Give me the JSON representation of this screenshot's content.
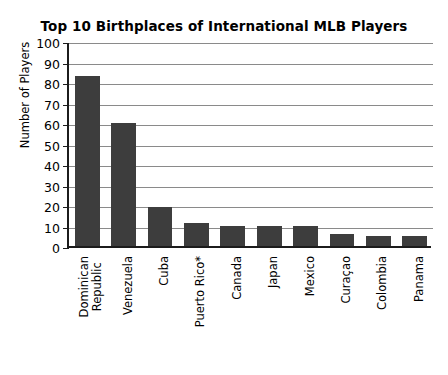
{
  "chart_data": {
    "type": "bar",
    "title": "Top 10 Birthplaces of International MLB Players",
    "xlabel": "",
    "ylabel": "Number of Players",
    "ylim": [
      0,
      100
    ],
    "ytick_step": 10,
    "ytick_labels": [
      "100",
      "90",
      "80",
      "70",
      "60",
      "50",
      "40",
      "30",
      "20",
      "10",
      "0"
    ],
    "ytick_values": [
      100,
      90,
      80,
      70,
      60,
      50,
      40,
      30,
      20,
      10,
      0
    ],
    "grid": "horizontal",
    "legend": "none",
    "bar_color": "#3d3d3d",
    "axis_color": "#1c1c1c",
    "grid_color": "#8a8a8a",
    "categories": [
      "Dominican Republic",
      "Venezuela",
      "Cuba",
      "Puerto Rico*",
      "Canada",
      "Japan",
      "Mexico",
      "Curaçao",
      "Colombia",
      "Panama"
    ],
    "category_lines": [
      [
        "Dominican",
        "Republic"
      ],
      [
        "Venezuela"
      ],
      [
        "Cuba"
      ],
      [
        "Puerto Rico*"
      ],
      [
        "Canada"
      ],
      [
        "Japan"
      ],
      [
        "Mexico"
      ],
      [
        "Curaçao"
      ],
      [
        "Colombia"
      ],
      [
        "Panama"
      ]
    ],
    "values": [
      83,
      60,
      19,
      11,
      10,
      10,
      10,
      6,
      5,
      5
    ],
    "annotations": [
      "* Puerto Rico marked with asterisk in axis label"
    ]
  }
}
